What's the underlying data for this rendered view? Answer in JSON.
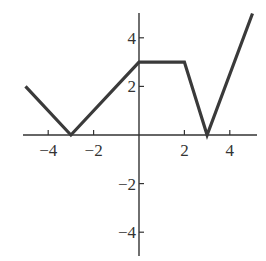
{
  "chart_data": {
    "type": "line",
    "title": "",
    "xlabel": "",
    "ylabel": "",
    "xlim": [
      -5.5,
      5.3
    ],
    "ylim": [
      -5,
      5
    ],
    "grid": false,
    "legend": null,
    "x_ticks": [
      -4,
      -2,
      2,
      4
    ],
    "y_ticks": [
      4,
      2,
      -2,
      -4
    ],
    "x_tick_labels": [
      "−4",
      "−2",
      "2",
      "4"
    ],
    "y_tick_labels": [
      "4",
      "2",
      "−2",
      "−4"
    ],
    "series": [
      {
        "name": "f(x)",
        "x": [
          -5,
          -3,
          0,
          2,
          3,
          5
        ],
        "y": [
          2,
          0,
          3,
          3,
          0,
          5
        ]
      }
    ]
  },
  "colors": {
    "line": "#3a3a3a",
    "axis": "#333333",
    "background": "#ffffff"
  }
}
